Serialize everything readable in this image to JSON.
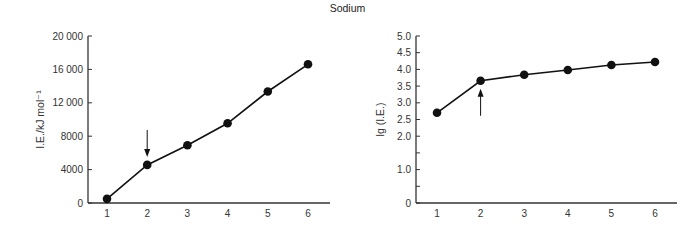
{
  "figure": {
    "title": "Sodium"
  },
  "chart_data": [
    {
      "type": "line",
      "title": "Sodium",
      "xlabel": "",
      "ylabel": "I.E./kJ mol⁻¹",
      "categories": [
        "1",
        "2",
        "3",
        "4",
        "5",
        "6"
      ],
      "x": [
        1,
        2,
        3,
        4,
        5,
        6
      ],
      "values": [
        496,
        4562,
        6912,
        9543,
        13353,
        16610
      ],
      "ylim": [
        0,
        20000
      ],
      "yticks": [
        0,
        4000,
        8000,
        12000,
        16000,
        20000
      ],
      "ytick_labels": [
        "0",
        "4000",
        "8000",
        "12 000",
        "16 000",
        "20 000"
      ],
      "annotations": [
        {
          "type": "arrow",
          "direction": "down",
          "at_x": 2,
          "note": "marks jump after 1st ionisation"
        }
      ],
      "grid": false,
      "marker": "filled-circle"
    },
    {
      "type": "line",
      "title": "Sodium",
      "xlabel": "",
      "ylabel": "lg (I.E.)",
      "categories": [
        "1",
        "2",
        "3",
        "4",
        "5",
        "6"
      ],
      "x": [
        1,
        2,
        3,
        4,
        5,
        6
      ],
      "values": [
        2.7,
        3.66,
        3.84,
        3.98,
        4.13,
        4.22
      ],
      "ylim": [
        0,
        5.0
      ],
      "yticks": [
        0,
        0.5,
        1.0,
        1.5,
        2.0,
        2.5,
        3.0,
        3.5,
        4.0,
        4.5,
        5.0
      ],
      "ytick_labels": [
        "0",
        "",
        "1.0",
        "",
        "2.0",
        "2.5",
        "3.0",
        "3.5",
        "4.0",
        "4.5",
        "5.0"
      ],
      "annotations": [
        {
          "type": "arrow",
          "direction": "up",
          "at_x": 2,
          "note": "marks jump after 1st ionisation"
        }
      ],
      "grid": false,
      "marker": "filled-circle"
    }
  ]
}
